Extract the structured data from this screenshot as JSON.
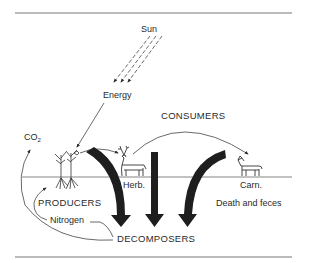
{
  "diagram": {
    "labels": {
      "sun": "Sun",
      "energy": "Energy",
      "consumers": "CONSUMERS",
      "co2_main": "CO",
      "co2_sub": "2",
      "herb": "Herb.",
      "carn": "Carn.",
      "producers": "PRODUCERS",
      "death_feces": "Death and feces",
      "nitrogen": "Nitrogen",
      "decomposers": "DECOMPOSERS"
    },
    "colors": {
      "ink": "#2a2a2a",
      "arrow_fill": "#1e1e1e",
      "line": "#555555",
      "background": "#ffffff"
    },
    "nodes": [
      "Sun",
      "Energy",
      "Producers",
      "Herbivore",
      "Carnivore",
      "Decomposers"
    ],
    "flows": [
      {
        "from": "Sun",
        "to": "Energy",
        "style": "dashed"
      },
      {
        "from": "Energy",
        "to": "Producers",
        "style": "solid"
      },
      {
        "from": "Producers",
        "to": "Herbivore",
        "style": "curved"
      },
      {
        "from": "Herbivore",
        "to": "Carnivore",
        "style": "curved"
      },
      {
        "from": "Producers",
        "to": "Decomposers",
        "style": "thick",
        "label": "Death and feces"
      },
      {
        "from": "Herbivore",
        "to": "Decomposers",
        "style": "thick"
      },
      {
        "from": "Carnivore",
        "to": "Decomposers",
        "style": "thick"
      },
      {
        "from": "Decomposers",
        "to": "CO2",
        "style": "curved"
      },
      {
        "from": "Decomposers",
        "to": "Producers",
        "style": "curved",
        "label": "Nitrogen"
      }
    ]
  }
}
